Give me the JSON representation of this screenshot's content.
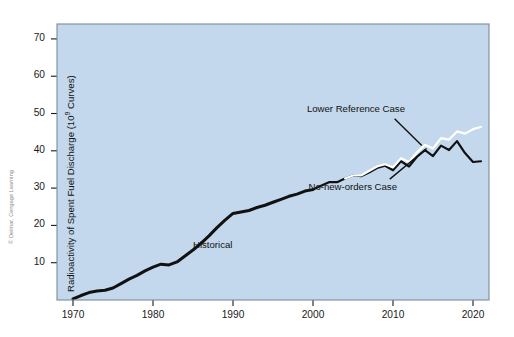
{
  "figure": {
    "plot_background_color": "#c3d8ec",
    "plot_border_color": "#7d8b99",
    "axis_color": "#1a1a1a",
    "historical_line_color": "#111111",
    "no_new_orders_line_color": "#111111",
    "lower_reference_line_color": "#ffffff",
    "copyright": "© Delmar, Cengage Learning"
  },
  "chart_data": {
    "type": "line",
    "title": "",
    "subtitle": "",
    "xlabel": "",
    "ylabel": "Radioactivity of Spent Fuel Discharge (10⁹ Curves)",
    "ylabel_parts": {
      "prefix": "Radioactivity of Spent Fuel Discharge (10",
      "exponent": "9",
      "suffix": " Curves)"
    },
    "xlim": [
      1968,
      2022
    ],
    "ylim": [
      0,
      74
    ],
    "grid": false,
    "legend_position": "inline-annotations",
    "x_ticks": [
      1970,
      1980,
      1990,
      2000,
      2010,
      2020
    ],
    "x_tick_labels": [
      "1970",
      "1980",
      "1990",
      "2000",
      "2010",
      "2020"
    ],
    "y_ticks": [
      10,
      20,
      30,
      40,
      50,
      60,
      70
    ],
    "y_tick_labels": [
      "10",
      "20",
      "30",
      "40",
      "50",
      "60",
      "70"
    ],
    "annotations": [
      {
        "id": "historical",
        "text": "Historical",
        "x": 1985.0,
        "y": 14.5
      },
      {
        "id": "lower-reference-case",
        "text": "Lower Reference Case",
        "x": 2011.5,
        "y": 51.0
      },
      {
        "id": "no-new-orders-case",
        "text": "No-new-orders Case",
        "x": 2010.5,
        "y": 30.0
      }
    ],
    "series": [
      {
        "name": "Historical",
        "color": "#111111",
        "x": [
          1970.0,
          1971.0,
          1972.0,
          1973.0,
          1974.0,
          1975.0,
          1976.0,
          1977.0,
          1978.0,
          1979.0,
          1980.0,
          1981.0,
          1982.0,
          1983.0,
          1984.0,
          1985.0,
          1986.0,
          1987.0,
          1988.0,
          1989.0,
          1990.0,
          1991.0,
          1992.0,
          1993.0,
          1994.0,
          1995.0,
          1996.0,
          1997.0,
          1998.0,
          1999.0,
          2000.0
        ],
        "values": [
          0.3,
          1.2,
          2.0,
          2.4,
          2.6,
          3.2,
          4.4,
          5.6,
          6.6,
          7.8,
          8.8,
          9.6,
          9.4,
          10.2,
          11.8,
          13.4,
          15.2,
          17.2,
          19.4,
          21.4,
          23.2,
          23.6,
          24.0,
          24.8,
          25.4,
          26.2,
          27.0,
          27.8,
          28.4,
          29.2,
          29.6
        ]
      },
      {
        "name": "No-new-orders Case",
        "color": "#111111",
        "x": [
          2000.0,
          2001.0,
          2002.0,
          2003.0,
          2004.0,
          2005.0,
          2006.0,
          2007.0,
          2008.0,
          2009.0,
          2010.0,
          2011.0,
          2012.0,
          2013.0,
          2014.0,
          2015.0,
          2016.0,
          2017.0,
          2018.0,
          2019.0,
          2020.0,
          2021.0
        ],
        "values": [
          29.6,
          30.6,
          31.6,
          31.6,
          32.6,
          33.4,
          33.2,
          34.2,
          35.4,
          36.0,
          34.8,
          37.2,
          35.8,
          38.4,
          40.2,
          38.6,
          41.4,
          40.2,
          42.6,
          39.4,
          37.0,
          37.2
        ]
      },
      {
        "name": "Lower Reference Case",
        "color": "#ffffff",
        "x": [
          2004.0,
          2005.0,
          2006.0,
          2007.0,
          2008.0,
          2009.0,
          2010.0,
          2011.0,
          2012.0,
          2013.0,
          2014.0,
          2015.0,
          2016.0,
          2017.0,
          2018.0,
          2019.0,
          2020.0,
          2021.0
        ],
        "values": [
          32.6,
          33.4,
          33.4,
          34.6,
          35.8,
          36.4,
          35.6,
          38.0,
          37.0,
          39.6,
          41.6,
          40.6,
          43.4,
          43.0,
          45.2,
          44.6,
          45.8,
          46.4
        ]
      }
    ],
    "leader_lines": [
      {
        "id": "lower-reference-leader",
        "from_x": 2010.2,
        "from_y": 48.6,
        "to_x": 2013.6,
        "to_y": 41.4
      },
      {
        "id": "no-new-orders-leader",
        "from_x": 2009.6,
        "from_y": 32.4,
        "to_x": 2014.2,
        "to_y": 40.6
      }
    ]
  }
}
